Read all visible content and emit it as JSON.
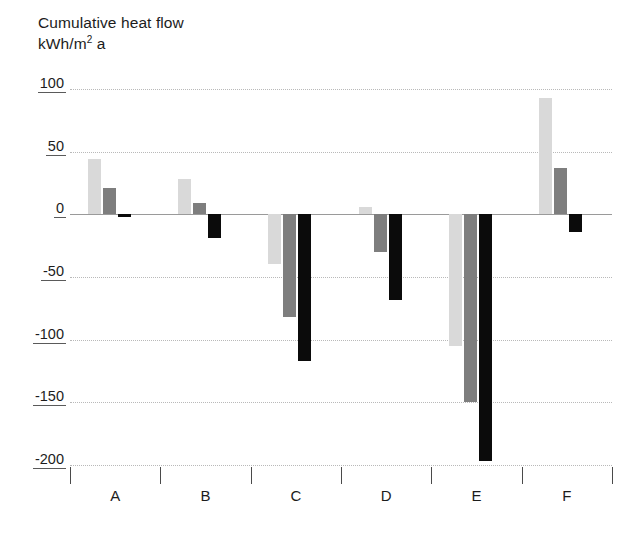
{
  "chart_data": {
    "type": "bar",
    "title": "Cumulative heat flow",
    "subtitle_prefix": "kWh/m",
    "subtitle_sup": "2",
    "subtitle_suffix": " a",
    "ylabel": "kWh/m2 a",
    "xlabel": "",
    "categories": [
      "A",
      "B",
      "C",
      "D",
      "E",
      "F"
    ],
    "ylim": [
      -200,
      100
    ],
    "yticks": [
      100,
      50,
      0,
      -50,
      -100,
      -150,
      -200
    ],
    "ytick_labels": [
      "100",
      "50",
      "0",
      "-50",
      "-100",
      "-150",
      "-200"
    ],
    "grid": true,
    "legend": "none",
    "series": [
      {
        "name": "series-light",
        "color": "#d9d9d9",
        "values": [
          44,
          28,
          -40,
          6,
          -105,
          93
        ]
      },
      {
        "name": "series-medium",
        "color": "#7e7e7e",
        "values": [
          21,
          9,
          -82,
          -30,
          -150,
          37
        ]
      },
      {
        "name": "series-dark",
        "color": "#0b0b0b",
        "values": [
          -2,
          -19,
          -117,
          -68,
          -197,
          -14
        ]
      }
    ]
  },
  "colors": {
    "background": "#ffffff",
    "text": "#1c1c1c",
    "gridline": "#b9b9b9",
    "zeroline": "#9a9a9a",
    "tick": "#4a4a4a",
    "bar_light": "#d9d9d9",
    "bar_medium": "#7e7e7e",
    "bar_dark": "#0b0b0b"
  }
}
